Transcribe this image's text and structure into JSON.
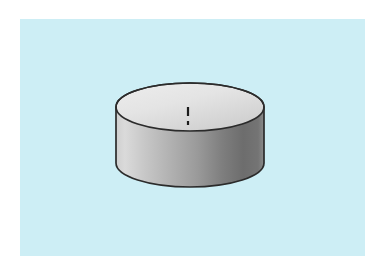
{
  "figure": {
    "title": "Solid of revolution: right circular cylinder (disc) with vertical axis of symmetry",
    "caption": "",
    "canvas": {
      "width": 383,
      "height": 276,
      "background_color": "#ffffff"
    },
    "panel": {
      "name": "light-blue-background-panel",
      "x": 20,
      "y": 19,
      "width": 345,
      "height": 237,
      "fill_color": "#cdeef5"
    },
    "solid": {
      "shape_name": "cylinder",
      "label": "",
      "center_x": 190,
      "top_ellipse_center_y": 107,
      "bottom_ellipse_center_y": 163,
      "radius_x": 74,
      "radius_y": 24,
      "body_height": 56,
      "outline_color": "#2b2b2b",
      "outline_width": 1.6,
      "top_face_fill_light": "#eaeaea",
      "top_face_fill_dark": "#cfcfcf",
      "side_fill_left": "#d9d9d9",
      "side_fill_mid": "#adadad",
      "side_fill_right": "#6d6d6d",
      "side_fill_far_right": "#8a8a8a"
    },
    "axis": {
      "name": "axis-of-symmetry",
      "label": "",
      "x": 188,
      "top_y": 33,
      "bottom_y": 243,
      "color": "#1b1b1b",
      "stroke_width": 2.2,
      "style": "dash-dot",
      "dash_pattern": "9 4 2 4"
    }
  }
}
